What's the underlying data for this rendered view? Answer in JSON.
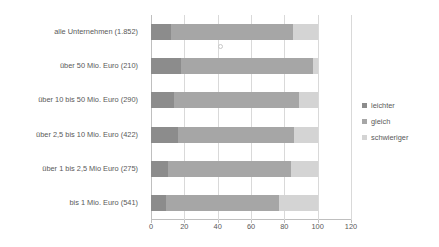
{
  "chart_data": {
    "type": "bar",
    "orientation": "horizontal",
    "stacked": true,
    "title": "",
    "subtitle": "",
    "xlabel": "",
    "ylabel": "",
    "xlim": [
      0,
      120
    ],
    "xticks": [
      0,
      20,
      40,
      60,
      80,
      100,
      120
    ],
    "xtick_labels": [
      "0",
      "20",
      "40",
      "60",
      "80",
      "100",
      "120"
    ],
    "grid": true,
    "grid_axis": "x",
    "legend_position": "right",
    "categories": [
      "alle Unternehmen (1.852)",
      "über 50 Mio. Euro (210)",
      "über 10 bis 50 Mio. Euro (290)",
      "über 2,5 bis 10 Mio. Euro (422)",
      "über 1 bis 2,5 Mio Euro (275)",
      "bis 1 Mio. Euro (541)"
    ],
    "series": [
      {
        "name": "leichter",
        "color": "#8c8c8c",
        "values": [
          12,
          18,
          14,
          16,
          10,
          9
        ]
      },
      {
        "name": "gleich",
        "color": "#a6a6a6",
        "values": [
          73,
          79,
          75,
          70,
          74,
          68
        ]
      },
      {
        "name": "schwieriger",
        "color": "#d4d4d4",
        "values": [
          15,
          3,
          11,
          14,
          16,
          23
        ]
      }
    ]
  },
  "legend": {
    "items": [
      {
        "label": "leichter",
        "color": "#8c8c8c"
      },
      {
        "label": "gleich",
        "color": "#a6a6a6"
      },
      {
        "label": "schwieriger",
        "color": "#d4d4d4"
      }
    ]
  },
  "colors": {
    "gridline": "#d9d9d9",
    "axis": "#bfbfbf",
    "text": "#595959",
    "background": "#ffffff"
  }
}
